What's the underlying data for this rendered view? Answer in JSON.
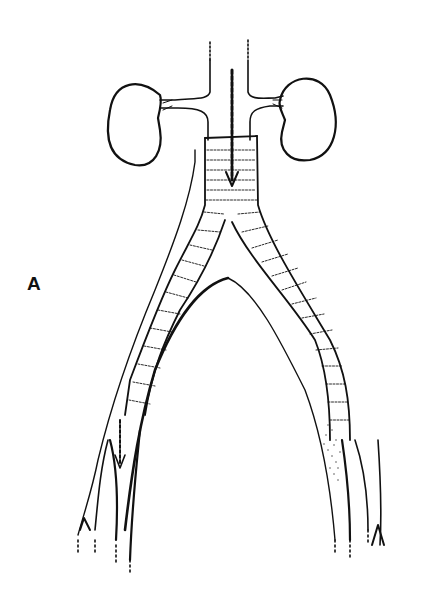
{
  "figure": {
    "panel_label": "A",
    "parts": [
      "left-kidney",
      "right-kidney",
      "aorta",
      "renal-arteries",
      "bifurcated-graft",
      "iliac-arteries",
      "femoral-arteries",
      "flow-arrows"
    ],
    "line_color": "#111111",
    "background": "#ffffff"
  }
}
